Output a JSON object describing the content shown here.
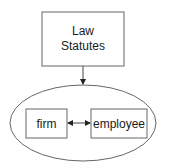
{
  "diagram": {
    "nodes": {
      "law_statutes": {
        "line1": "Law",
        "line2": "Statutes"
      },
      "firm": {
        "label": "firm"
      },
      "employee": {
        "label": "employee"
      }
    },
    "edges": [
      {
        "from": "law_statutes",
        "to": "ellipse-group",
        "type": "directed"
      },
      {
        "from": "firm",
        "to": "employee",
        "type": "bidirectional"
      }
    ],
    "colors": {
      "stroke": "#555555",
      "text": "#1a1a1a",
      "background": "#ffffff"
    }
  }
}
